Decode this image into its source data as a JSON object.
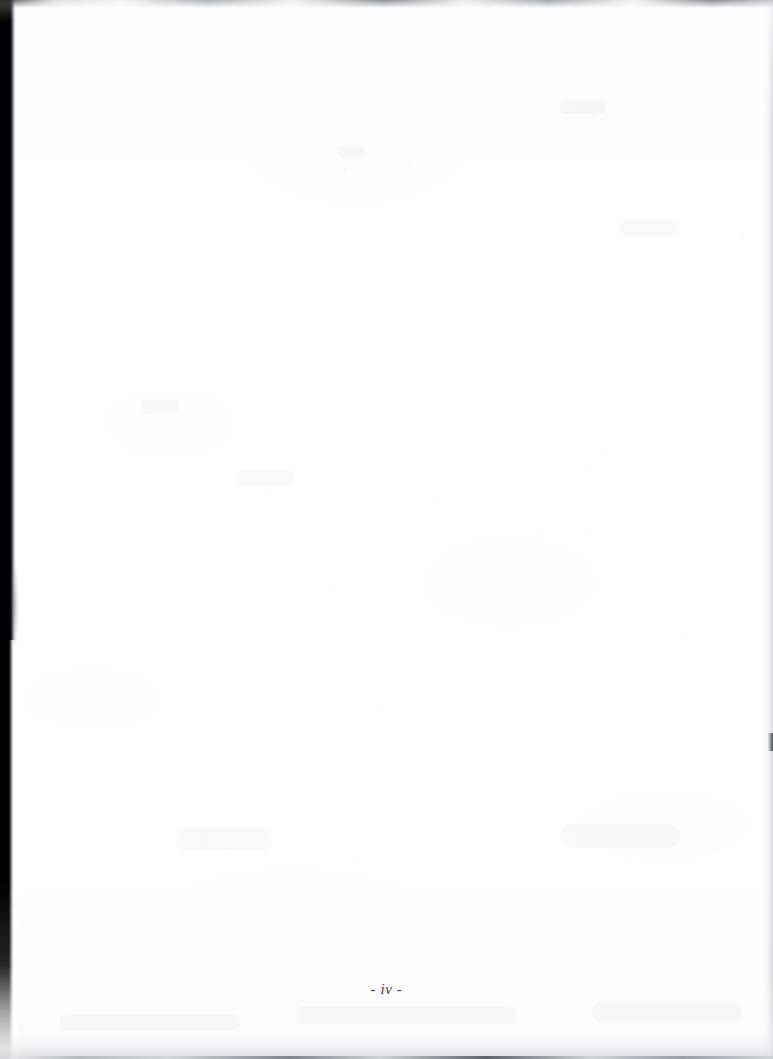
{
  "document": {
    "kind": "scanned-page",
    "page_is_blank": true,
    "background_color": "#fdfdfe"
  },
  "footer": {
    "folio": "- iv -",
    "folio_value": "iv",
    "folio_style": "italic-serif",
    "folio_color": "#3a3d42"
  },
  "scan_artifacts": {
    "left_shadow_label": "left-gutter-shadow",
    "left_shadow_color": "#000000",
    "top_strip_label": "top-edge-strip",
    "right_edge_label": "right-edge-shading",
    "right_mark_label": "right-edge-mark",
    "bottom_edge_label": "bottom-edge-shading"
  }
}
